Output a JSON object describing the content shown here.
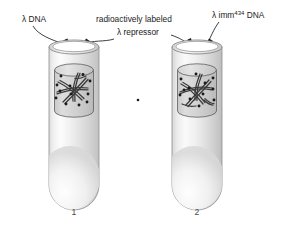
{
  "figure": {
    "background_color": "#ffffff",
    "labels": {
      "left": "λ DNA",
      "center_line1": "radioactively labeled",
      "center_line2": "λ repressor",
      "right_prefix": "λ imm",
      "right_superscript": "434",
      "right_suffix": " DNA"
    },
    "tubes": [
      {
        "number": "1",
        "contents": "λ DNA with radioactively labeled λ repressor bound",
        "dot_count": 12
      },
      {
        "number": "2",
        "contents": "λ imm434 DNA with radioactively labeled λ repressor",
        "dot_count": 12
      }
    ],
    "colors": {
      "glass_outline": "#8e8e8e",
      "inner_cylinder_outline": "#5d5d5d",
      "dna_strand": "#3a3a3a",
      "repressor_dot": "#1a1a1a",
      "label_text": "#1b1b1b",
      "number_text": "#4a4a4a",
      "leader_line": "#1b1b1b"
    }
  }
}
